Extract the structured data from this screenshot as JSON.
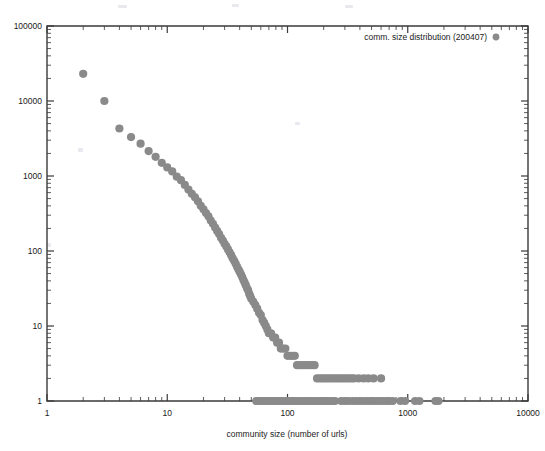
{
  "chart_data": {
    "type": "scatter",
    "title": "",
    "xlabel": "community size (number of urls)",
    "ylabel": "",
    "xscale": "log",
    "yscale": "log",
    "xlim": [
      1,
      10000
    ],
    "ylim": [
      1,
      100000
    ],
    "xticks": [
      1,
      10,
      100,
      1000,
      10000
    ],
    "xtick_labels": [
      "1",
      "10",
      "100",
      "1000",
      "10000"
    ],
    "yticks": [
      1,
      10,
      100,
      1000,
      10000,
      100000
    ],
    "ytick_labels": [
      "1",
      "10",
      "100",
      "1000",
      "10000",
      "100000"
    ],
    "grid": false,
    "legend_position": "top-right",
    "series": [
      {
        "name": "comm. size distribution (200407)",
        "marker": "circle",
        "color": "#8a8a8a",
        "points": [
          [
            2,
            23000
          ],
          [
            3,
            10000
          ],
          [
            4,
            4300
          ],
          [
            5,
            3300
          ],
          [
            6,
            2700
          ],
          [
            7,
            2150
          ],
          [
            8,
            1800
          ],
          [
            9,
            1500
          ],
          [
            10,
            1300
          ],
          [
            11,
            1150
          ],
          [
            12,
            980
          ],
          [
            13,
            880
          ],
          [
            14,
            760
          ],
          [
            15,
            660
          ],
          [
            16,
            580
          ],
          [
            17,
            520
          ],
          [
            18,
            460
          ],
          [
            19,
            400
          ],
          [
            20,
            360
          ],
          [
            21,
            320
          ],
          [
            22,
            290
          ],
          [
            23,
            255
          ],
          [
            24,
            230
          ],
          [
            25,
            205
          ],
          [
            26,
            185
          ],
          [
            27,
            168
          ],
          [
            28,
            150
          ],
          [
            29,
            138
          ],
          [
            30,
            125
          ],
          [
            31,
            115
          ],
          [
            32,
            105
          ],
          [
            33,
            96
          ],
          [
            34,
            88
          ],
          [
            35,
            80
          ],
          [
            36,
            74
          ],
          [
            37,
            68
          ],
          [
            38,
            62
          ],
          [
            39,
            57
          ],
          [
            40,
            53
          ],
          [
            41,
            49
          ],
          [
            42,
            45
          ],
          [
            43,
            41
          ],
          [
            44,
            38
          ],
          [
            45,
            35
          ],
          [
            46,
            32
          ],
          [
            47,
            30
          ],
          [
            48,
            27
          ],
          [
            49,
            25
          ],
          [
            50,
            23
          ],
          [
            52,
            21
          ],
          [
            54,
            19
          ],
          [
            56,
            17
          ],
          [
            58,
            15
          ],
          [
            60,
            14
          ],
          [
            62,
            12
          ],
          [
            64,
            11
          ],
          [
            66,
            10
          ],
          [
            68,
            9
          ],
          [
            70,
            8
          ],
          [
            73,
            8
          ],
          [
            76,
            7
          ],
          [
            79,
            7
          ],
          [
            82,
            6
          ],
          [
            85,
            6
          ],
          [
            88,
            5
          ],
          [
            92,
            5
          ],
          [
            96,
            5
          ],
          [
            100,
            4
          ],
          [
            105,
            4
          ],
          [
            110,
            4
          ],
          [
            115,
            4
          ],
          [
            120,
            3
          ],
          [
            126,
            3
          ],
          [
            132,
            3
          ],
          [
            138,
            3
          ],
          [
            145,
            3
          ],
          [
            152,
            3
          ],
          [
            160,
            3
          ],
          [
            168,
            3
          ],
          [
            176,
            2
          ],
          [
            185,
            2
          ],
          [
            195,
            2
          ],
          [
            205,
            2
          ],
          [
            215,
            2
          ],
          [
            226,
            2
          ],
          [
            238,
            2
          ],
          [
            250,
            2
          ],
          [
            263,
            2
          ],
          [
            277,
            2
          ],
          [
            291,
            2
          ],
          [
            306,
            2
          ],
          [
            322,
            2
          ],
          [
            339,
            2
          ],
          [
            357,
            2
          ],
          [
            390,
            2
          ],
          [
            430,
            2
          ],
          [
            470,
            2
          ],
          [
            520,
            2
          ],
          [
            600,
            2
          ],
          [
            55,
            1
          ],
          [
            58,
            1
          ],
          [
            61,
            1
          ],
          [
            64,
            1
          ],
          [
            67,
            1
          ],
          [
            70,
            1
          ],
          [
            74,
            1
          ],
          [
            78,
            1
          ],
          [
            82,
            1
          ],
          [
            86,
            1
          ],
          [
            90,
            1
          ],
          [
            95,
            1
          ],
          [
            100,
            1
          ],
          [
            105,
            1
          ],
          [
            110,
            1
          ],
          [
            116,
            1
          ],
          [
            122,
            1
          ],
          [
            128,
            1
          ],
          [
            135,
            1
          ],
          [
            142,
            1
          ],
          [
            149,
            1
          ],
          [
            157,
            1
          ],
          [
            165,
            1
          ],
          [
            174,
            1
          ],
          [
            183,
            1
          ],
          [
            192,
            1
          ],
          [
            202,
            1
          ],
          [
            213,
            1
          ],
          [
            224,
            1
          ],
          [
            236,
            1
          ],
          [
            248,
            1
          ],
          [
            280,
            1
          ],
          [
            300,
            1
          ],
          [
            320,
            1
          ],
          [
            345,
            1
          ],
          [
            370,
            1
          ],
          [
            395,
            1
          ],
          [
            420,
            1
          ],
          [
            450,
            1
          ],
          [
            480,
            1
          ],
          [
            510,
            1
          ],
          [
            545,
            1
          ],
          [
            580,
            1
          ],
          [
            620,
            1
          ],
          [
            660,
            1
          ],
          [
            700,
            1
          ],
          [
            750,
            1
          ],
          [
            870,
            1
          ],
          [
            950,
            1
          ],
          [
            1150,
            1
          ],
          [
            1250,
            1
          ],
          [
            1700,
            1
          ],
          [
            1800,
            1
          ]
        ]
      }
    ]
  },
  "legend": {
    "entries": [
      {
        "label": "comm. size distribution (200407)",
        "marker": "legend-dot"
      }
    ]
  },
  "axes": {
    "x_title": "community size (number of urls)",
    "y_title": ""
  }
}
